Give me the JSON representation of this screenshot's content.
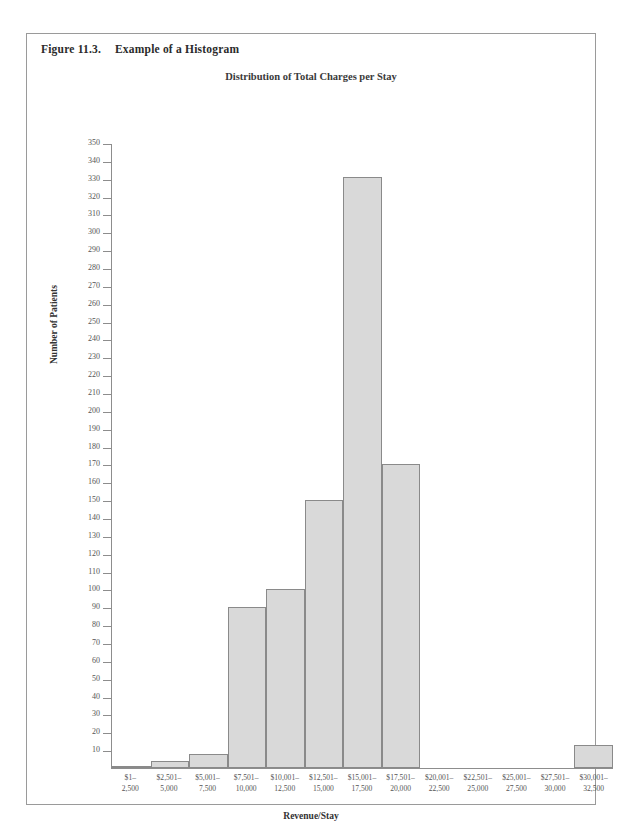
{
  "figure": {
    "number": "Figure 11.3.",
    "caption": "Example of a Histogram"
  },
  "chart_data": {
    "type": "bar",
    "title": "Distribution of Total Charges per Stay",
    "xlabel": "Revenue/Stay",
    "ylabel": "Number of Patients",
    "ylim": [
      0,
      350
    ],
    "ytick_step": 10,
    "grid": false,
    "legend": "none",
    "categories": [
      "$1–\n2,500",
      "$2,501–\n5,000",
      "$5,001–\n7,500",
      "$7,501–\n10,000",
      "$10,001–\n12,500",
      "$12,501–\n15,000",
      "$15,001–\n17,500",
      "$17,501–\n20,000",
      "$20,001–\n22,500",
      "$22,501–\n25,000",
      "$25,001–\n27,500",
      "$27,501–\n30,000",
      "$30,001–\n32,500"
    ],
    "category_lines": [
      [
        "$1–",
        "2,500"
      ],
      [
        "$2,501–",
        "5,000"
      ],
      [
        "$5,001–",
        "7,500"
      ],
      [
        "$7,501–",
        "10,000"
      ],
      [
        "$10,001–",
        "12,500"
      ],
      [
        "$12,501–",
        "15,000"
      ],
      [
        "$15,001–",
        "17,500"
      ],
      [
        "$17,501–",
        "20,000"
      ],
      [
        "$20,001–",
        "22,500"
      ],
      [
        "$22,501–",
        "25,000"
      ],
      [
        "$25,001–",
        "27,500"
      ],
      [
        "$27,501–",
        "30,000"
      ],
      [
        "$30,001–",
        "32,500"
      ]
    ],
    "values": [
      1,
      4,
      8,
      90,
      100,
      150,
      331,
      170,
      0,
      0,
      0,
      0,
      13
    ],
    "yticks": [
      350,
      340,
      330,
      320,
      310,
      300,
      290,
      280,
      270,
      260,
      250,
      240,
      230,
      220,
      210,
      200,
      190,
      180,
      170,
      160,
      150,
      140,
      130,
      120,
      110,
      100,
      90,
      80,
      70,
      60,
      50,
      40,
      30,
      20,
      10
    ],
    "colors": {
      "bar_fill": "#d9d9d9",
      "bar_border": "#8a8a8a",
      "axis": "#8d8d8d",
      "text": "#555555"
    }
  }
}
